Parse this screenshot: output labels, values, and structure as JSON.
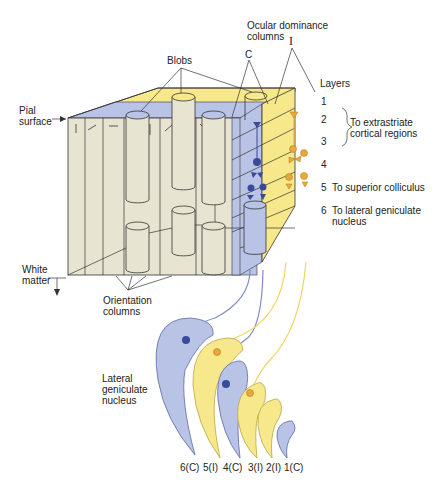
{
  "labels": {
    "blobs": "Blobs",
    "ocular_dominance": "Ocular dominance\ncolumns",
    "contralateral": "C",
    "ipsilateral": "I",
    "layers": "Layers",
    "pial_surface": "Pial\nsurface",
    "white_matter": "White\nmatter",
    "orientation_columns": "Orientation\ncolumns",
    "lateral_geniculate_nucleus": "Lateral\ngeniculate\nnucleus"
  },
  "cortical_layers": [
    {
      "number": "1",
      "annotation": ""
    },
    {
      "number": "2",
      "annotation": ""
    },
    {
      "number": "3",
      "annotation": ""
    },
    {
      "number": "4",
      "annotation": ""
    },
    {
      "number": "5",
      "annotation": "To superior colliculus"
    },
    {
      "number": "6",
      "annotation": "To lateral geniculate\nnucleus"
    }
  ],
  "bracket_annotation": "To extrastriate\ncortical regions",
  "lgn_layers": [
    "6(C)",
    "5(I)",
    "4(C)",
    "3(I)",
    "2(I)",
    "1(C)"
  ],
  "colors": {
    "beige": "#e8e4d2",
    "blue": "#b9c3e6",
    "blue_dark": "#3a4a9a",
    "yellow": "#f7e88c",
    "orange": "#e8a93a",
    "line": "#333333"
  }
}
